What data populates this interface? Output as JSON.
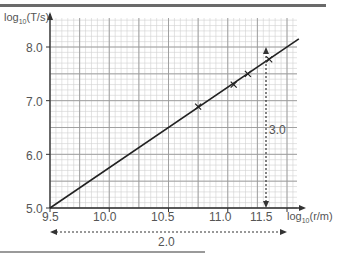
{
  "chart_data": {
    "type": "scatter",
    "title": "",
    "xlabel": "log10(r/m)",
    "ylabel": "log10(T/s)",
    "xlim": [
      9.5,
      11.65
    ],
    "ylim": [
      5.0,
      8.3
    ],
    "x_ticks": [
      "9.5",
      "10.0",
      "10.5",
      "11.0",
      "11.5"
    ],
    "y_ticks": [
      "5.0",
      "6.0",
      "7.0",
      "8.0"
    ],
    "grid": true,
    "points": [
      {
        "x": 10.75,
        "y": 6.89
      },
      {
        "x": 11.05,
        "y": 7.3
      },
      {
        "x": 11.17,
        "y": 7.5
      },
      {
        "x": 11.35,
        "y": 7.77
      }
    ],
    "best_fit_line": {
      "x": [
        9.5,
        11.6
      ],
      "y": [
        5.0,
        8.15
      ],
      "gradient": 1.5
    },
    "annotations": [
      {
        "text": "2.0",
        "type": "horizontal-dashed-arrow",
        "from_x": 9.5,
        "to_x": 11.5
      },
      {
        "text": "3.0",
        "type": "vertical-dashed-arrow",
        "from_y": 5.0,
        "to_y": 8.0,
        "at_x": 11.45
      }
    ]
  },
  "labels": {
    "y_axis_main": "log",
    "y_axis_sub": "10",
    "y_axis_rest": "(T/s)",
    "x_axis_main": "log",
    "x_axis_sub": "10",
    "x_axis_rest": "(r/m)",
    "y_ticks": [
      "8.0",
      "7.0",
      "6.0",
      "5.0"
    ],
    "x_ticks": [
      "9.5",
      "10.0",
      "10.5",
      "11.0",
      "11.5"
    ],
    "dx_label": "2.0",
    "dy_label": "3.0"
  },
  "colors": {
    "axis": "#333333",
    "grid_major": "#9a9a9a",
    "grid_minor": "#d0d0d0",
    "line": "#222222",
    "text": "#555555"
  }
}
